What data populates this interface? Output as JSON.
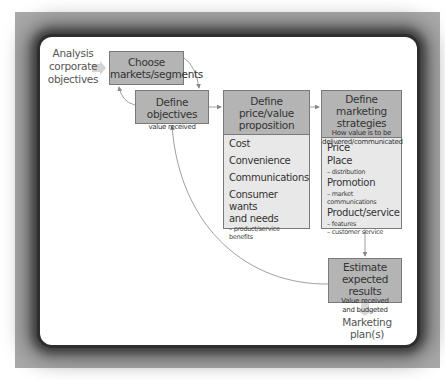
{
  "diagram": {
    "input": {
      "label": "Analysis corporate objectives",
      "lines": [
        "Analysis",
        "corporate",
        "objectives"
      ]
    },
    "nodes": {
      "choose": {
        "title_lines": [
          "Choose",
          "markets/segments"
        ]
      },
      "objectives": {
        "title": "Define objectives",
        "subtitle": "value received"
      },
      "price": {
        "title_lines": [
          "Define",
          "price/value",
          "proposition"
        ],
        "items": [
          {
            "label": "Cost"
          },
          {
            "label": "Convenience"
          },
          {
            "label": "Communications"
          },
          {
            "label_lines": [
              "Consumer wants",
              "and needs"
            ],
            "sub": [
              "– product/service benefits"
            ]
          }
        ]
      },
      "strategies": {
        "title_lines": [
          "Define marketing",
          "strategies"
        ],
        "subtitle_lines": [
          "How value is to be",
          "delivered/communicated"
        ],
        "items": [
          {
            "label": "Price"
          },
          {
            "label": "Place",
            "sub": [
              "– distribution"
            ]
          },
          {
            "label": "Promotion",
            "sub": [
              "– market communications"
            ]
          },
          {
            "label": "Product/service",
            "sub": [
              "– features",
              "– customer service"
            ]
          }
        ]
      },
      "estimate": {
        "title_lines": [
          "Estimate expected",
          "results"
        ],
        "subtitle_lines": [
          "Value received",
          "and budgeted"
        ]
      }
    },
    "output": {
      "label": "Marketing plan(s)"
    },
    "edges": [
      {
        "from": "input",
        "to": "choose",
        "style": "block-arrow"
      },
      {
        "from": "choose",
        "to": "objectives",
        "style": "curved"
      },
      {
        "from": "objectives",
        "to": "choose",
        "style": "curved"
      },
      {
        "from": "objectives",
        "to": "price",
        "style": "straight"
      },
      {
        "from": "price",
        "to": "strategies",
        "style": "straight"
      },
      {
        "from": "strategies",
        "to": "estimate",
        "style": "straight"
      },
      {
        "from": "estimate",
        "to": "objectives",
        "style": "curved-feedback"
      },
      {
        "from": "estimate",
        "to": "output",
        "style": "block-arrow"
      }
    ],
    "colors": {
      "box_header": "#b4b4b4",
      "box_body": "#e8e8e8",
      "frame": "#a9a9a9",
      "line": "#888888"
    }
  }
}
